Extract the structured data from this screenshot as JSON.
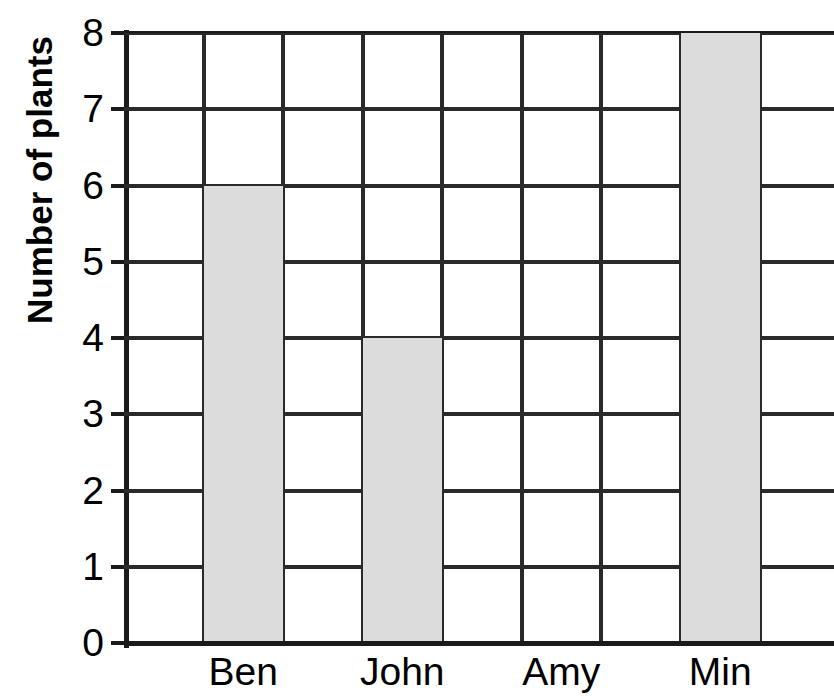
{
  "chart_data": {
    "type": "bar",
    "title": "",
    "xlabel": "",
    "ylabel": "Number of plants",
    "categories": [
      "Ben",
      "John",
      "Amy",
      "Min"
    ],
    "values": [
      6,
      4,
      0,
      8
    ],
    "ylim": [
      0,
      8
    ],
    "y_ticks": [
      0,
      1,
      2,
      3,
      4,
      5,
      6,
      7,
      8
    ],
    "y_tick_labels": [
      "0",
      "1",
      "2",
      "3",
      "4",
      "5",
      "6",
      "7",
      "8"
    ],
    "grid": true,
    "legend": "none",
    "bar_color": "#dcdcdc",
    "bar_edge_color": "#2a2a2a",
    "axis_color": "#1a1a1a",
    "background_color": "#ffffff",
    "series": [
      {
        "name": "Number of plants",
        "values": [
          6,
          4,
          0,
          8
        ]
      }
    ]
  },
  "axis": {
    "y_title": "Number of plants",
    "y_ticks": [
      "0",
      "1",
      "2",
      "3",
      "4",
      "5",
      "6",
      "7",
      "8"
    ]
  },
  "columns": [
    {
      "label": "",
      "value": null
    },
    {
      "label": "Ben",
      "value": 6
    },
    {
      "label": "",
      "value": null
    },
    {
      "label": "John",
      "value": 4
    },
    {
      "label": "",
      "value": null
    },
    {
      "label": "Amy",
      "value": 0
    },
    {
      "label": "",
      "value": null
    },
    {
      "label": "Min",
      "value": 8
    },
    {
      "label": "",
      "value": null
    }
  ],
  "x_labels": [
    "Ben",
    "John",
    "Amy",
    "Min"
  ],
  "title": {
    "text": ""
  }
}
